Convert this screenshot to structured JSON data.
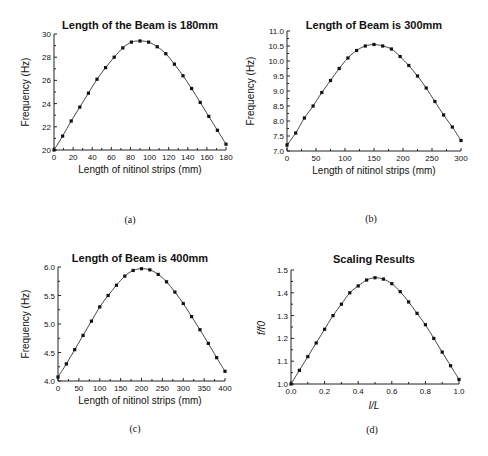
{
  "figure": {
    "panels": [
      {
        "id": "a",
        "caption": "(a)"
      },
      {
        "id": "b",
        "caption": "(b)"
      },
      {
        "id": "c",
        "caption": "(c)"
      },
      {
        "id": "d",
        "caption": "(d)"
      }
    ]
  },
  "chart_data": [
    {
      "type": "line",
      "panel": "(a)",
      "title": "Length of the Beam is 180mm",
      "xlabel": "Length of nitinol strips (mm)",
      "ylabel": "Frequency (Hz)",
      "xlim": [
        0,
        180
      ],
      "ylim": [
        20,
        30
      ],
      "xticks": [
        0,
        20,
        40,
        60,
        80,
        100,
        120,
        140,
        160,
        180
      ],
      "yticks": [
        20,
        22,
        24,
        26,
        28,
        30
      ],
      "grid": false,
      "series": [
        {
          "name": "Frequency",
          "marker": "square",
          "x": [
            0,
            9,
            18,
            27,
            36,
            45,
            54,
            63,
            72,
            81,
            90,
            99,
            108,
            117,
            126,
            135,
            144,
            153,
            162,
            171,
            180
          ],
          "y": [
            20.0,
            21.2,
            22.5,
            23.7,
            24.9,
            26.1,
            27.1,
            28.0,
            28.8,
            29.3,
            29.4,
            29.3,
            28.9,
            28.3,
            27.4,
            26.4,
            25.3,
            24.1,
            22.9,
            21.7,
            20.5
          ]
        }
      ]
    },
    {
      "type": "line",
      "panel": "(b)",
      "title": "Length of Beam is 300mm",
      "xlabel": "Length of nitinol strips (mm)",
      "ylabel": "Frequency (Hz)",
      "xlim": [
        0,
        300
      ],
      "ylim": [
        7.0,
        11.0
      ],
      "xticks": [
        0,
        50,
        100,
        150,
        200,
        250,
        300
      ],
      "yticks": [
        7.0,
        7.5,
        8.0,
        8.5,
        9.0,
        9.5,
        10.0,
        10.5,
        11.0
      ],
      "grid": false,
      "series": [
        {
          "name": "Frequency",
          "marker": "square",
          "x": [
            0,
            15,
            30,
            45,
            60,
            75,
            90,
            105,
            120,
            135,
            150,
            165,
            180,
            195,
            210,
            225,
            240,
            255,
            270,
            285,
            300
          ],
          "y": [
            7.2,
            7.6,
            8.1,
            8.5,
            8.95,
            9.35,
            9.75,
            10.1,
            10.35,
            10.5,
            10.55,
            10.5,
            10.4,
            10.15,
            9.85,
            9.5,
            9.1,
            8.65,
            8.2,
            7.8,
            7.35
          ]
        }
      ]
    },
    {
      "type": "line",
      "panel": "(c)",
      "title": "Length of Beam is 400mm",
      "xlabel": "Length of nitinol strips (mm)",
      "ylabel": "Frequency (Hz)",
      "xlim": [
        0,
        400
      ],
      "ylim": [
        4.0,
        6.0
      ],
      "xticks": [
        0,
        50,
        100,
        150,
        200,
        250,
        300,
        350,
        400
      ],
      "yticks": [
        4.0,
        4.5,
        5.0,
        5.5,
        6.0
      ],
      "grid": false,
      "series": [
        {
          "name": "Frequency",
          "marker": "square",
          "x": [
            0,
            20,
            40,
            60,
            80,
            100,
            120,
            140,
            160,
            180,
            200,
            220,
            240,
            260,
            280,
            300,
            320,
            340,
            360,
            380,
            400
          ],
          "y": [
            4.07,
            4.3,
            4.55,
            4.8,
            5.05,
            5.3,
            5.5,
            5.68,
            5.84,
            5.94,
            5.97,
            5.95,
            5.87,
            5.74,
            5.56,
            5.36,
            5.13,
            4.9,
            4.66,
            4.41,
            4.17
          ]
        }
      ]
    },
    {
      "type": "line",
      "panel": "(d)",
      "title": "Scaling Results",
      "xlabel": "l/L",
      "ylabel": "f/f0",
      "xlim": [
        0.0,
        1.0
      ],
      "ylim": [
        1.0,
        1.5
      ],
      "xticks": [
        0.0,
        0.2,
        0.4,
        0.6,
        0.8,
        1.0
      ],
      "yticks": [
        1.0,
        1.1,
        1.2,
        1.3,
        1.4,
        1.5
      ],
      "grid": false,
      "series": [
        {
          "name": "f/f0",
          "marker": "square",
          "x": [
            0.0,
            0.05,
            0.1,
            0.15,
            0.2,
            0.25,
            0.3,
            0.35,
            0.4,
            0.45,
            0.5,
            0.55,
            0.6,
            0.65,
            0.7,
            0.75,
            0.8,
            0.85,
            0.9,
            0.95,
            1.0
          ],
          "y": [
            1.0,
            1.06,
            1.12,
            1.18,
            1.24,
            1.3,
            1.35,
            1.4,
            1.43,
            1.456,
            1.466,
            1.46,
            1.44,
            1.405,
            1.36,
            1.31,
            1.26,
            1.2,
            1.14,
            1.08,
            1.02
          ]
        }
      ]
    }
  ]
}
